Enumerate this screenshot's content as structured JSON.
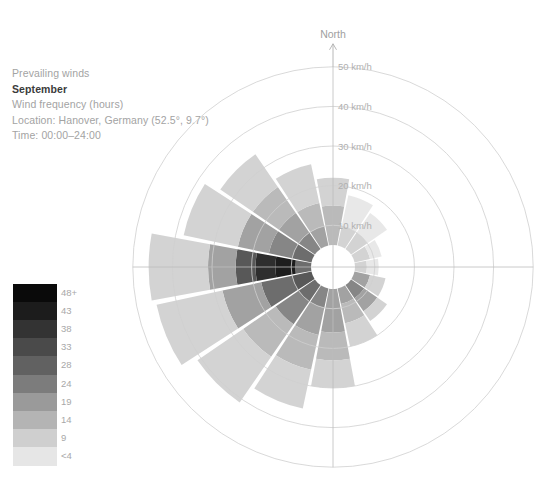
{
  "caption": {
    "line1": "Prevailing winds",
    "month": "September",
    "line3": "Wind frequency (hours)",
    "line4": "Location: Hanover, Germany (52.5°, 9.7°)",
    "line5": "Time: 00:00–24:00"
  },
  "compass": {
    "north_label": "North"
  },
  "legend": {
    "title": "",
    "labels": [
      "48+",
      "43",
      "38",
      "33",
      "28",
      "24",
      "19",
      "14",
      "9",
      "<4"
    ],
    "colors": [
      "#0a0a0a",
      "#1c1c1c",
      "#333333",
      "#4a4a4a",
      "#616161",
      "#7c7c7c",
      "#9a9a9a",
      "#b4b4b4",
      "#cfcfcf",
      "#e6e6e6"
    ]
  },
  "chart_data": {
    "type": "windrose",
    "subtitle": "Wind frequency (hours)",
    "location": "Hanover, Germany (52.5°, 9.7°)",
    "time_range": "00:00–24:00",
    "radial_axis": {
      "label": "km/h",
      "tick_labels": [
        "10 km/h",
        "20 km/h",
        "30 km/h",
        "40 km/h",
        "50 km/h"
      ],
      "ticks": [
        10,
        20,
        30,
        40,
        50
      ],
      "rmax": 50,
      "hole": 5
    },
    "color_axis": {
      "label": "Wind frequency (hours)",
      "tick_labels": [
        "<4",
        "9",
        "14",
        "19",
        "24",
        "28",
        "33",
        "38",
        "43",
        "48+"
      ],
      "values": [
        4,
        9,
        14,
        19,
        24,
        28,
        33,
        38,
        43,
        48
      ]
    },
    "grid": true,
    "sector_count": 16,
    "directions": [
      "N",
      "NNE",
      "NE",
      "ENE",
      "E",
      "ESE",
      "SE",
      "SSE",
      "S",
      "SSW",
      "SW",
      "WSW",
      "W",
      "WNW",
      "NW",
      "NNW"
    ],
    "sectors": [
      {
        "dir": "N",
        "angle": 0,
        "max_speed": 22,
        "bands": [
          {
            "from": 5,
            "to": 10,
            "hours": 14
          },
          {
            "from": 10,
            "to": 15,
            "hours": 14
          },
          {
            "from": 15,
            "to": 22,
            "hours": 9
          }
        ]
      },
      {
        "dir": "NNE",
        "angle": 22.5,
        "max_speed": 18,
        "bands": [
          {
            "from": 5,
            "to": 10,
            "hours": 9
          },
          {
            "from": 10,
            "to": 18,
            "hours": 4
          }
        ]
      },
      {
        "dir": "NE",
        "angle": 45,
        "max_speed": 16,
        "bands": [
          {
            "from": 5,
            "to": 10,
            "hours": 9
          },
          {
            "from": 10,
            "to": 16,
            "hours": 4
          }
        ]
      },
      {
        "dir": "ENE",
        "angle": 67.5,
        "max_speed": 12,
        "bands": [
          {
            "from": 5,
            "to": 9,
            "hours": 9
          },
          {
            "from": 9,
            "to": 12,
            "hours": 4
          }
        ]
      },
      {
        "dir": "E",
        "angle": 90,
        "max_speed": 11,
        "bands": [
          {
            "from": 5,
            "to": 8,
            "hours": 9
          },
          {
            "from": 8,
            "to": 11,
            "hours": 4
          }
        ]
      },
      {
        "dir": "ESE",
        "angle": 112.5,
        "max_speed": 13,
        "bands": [
          {
            "from": 5,
            "to": 9,
            "hours": 19
          },
          {
            "from": 9,
            "to": 13,
            "hours": 9
          }
        ]
      },
      {
        "dir": "SE",
        "angle": 135,
        "max_speed": 16,
        "bands": [
          {
            "from": 5,
            "to": 9,
            "hours": 24
          },
          {
            "from": 9,
            "to": 13,
            "hours": 19
          },
          {
            "from": 13,
            "to": 16,
            "hours": 9
          }
        ]
      },
      {
        "dir": "SSE",
        "angle": 157.5,
        "max_speed": 20,
        "bands": [
          {
            "from": 5,
            "to": 9,
            "hours": 19
          },
          {
            "from": 9,
            "to": 14,
            "hours": 14
          },
          {
            "from": 14,
            "to": 20,
            "hours": 9
          }
        ]
      },
      {
        "dir": "S",
        "angle": 180,
        "max_speed": 30,
        "bands": [
          {
            "from": 5,
            "to": 10,
            "hours": 19
          },
          {
            "from": 10,
            "to": 16,
            "hours": 19
          },
          {
            "from": 16,
            "to": 23,
            "hours": 14
          },
          {
            "from": 23,
            "to": 30,
            "hours": 9
          }
        ]
      },
      {
        "dir": "SSW",
        "angle": 202.5,
        "max_speed": 36,
        "bands": [
          {
            "from": 5,
            "to": 10,
            "hours": 24
          },
          {
            "from": 10,
            "to": 17,
            "hours": 19
          },
          {
            "from": 17,
            "to": 26,
            "hours": 14
          },
          {
            "from": 26,
            "to": 36,
            "hours": 9
          }
        ]
      },
      {
        "dir": "SW",
        "angle": 225,
        "max_speed": 41,
        "bands": [
          {
            "from": 5,
            "to": 10,
            "hours": 28
          },
          {
            "from": 10,
            "to": 17,
            "hours": 24
          },
          {
            "from": 17,
            "to": 27,
            "hours": 14
          },
          {
            "from": 27,
            "to": 41,
            "hours": 9
          }
        ]
      },
      {
        "dir": "WSW",
        "angle": 247.5,
        "max_speed": 45,
        "bands": [
          {
            "from": 5,
            "to": 10,
            "hours": 33
          },
          {
            "from": 10,
            "to": 18,
            "hours": 28
          },
          {
            "from": 18,
            "to": 28,
            "hours": 19
          },
          {
            "from": 28,
            "to": 45,
            "hours": 9
          }
        ]
      },
      {
        "dir": "W",
        "angle": 270,
        "max_speed": 46,
        "bands": [
          {
            "from": 5,
            "to": 9,
            "hours": 28
          },
          {
            "from": 9,
            "to": 14,
            "hours": 48
          },
          {
            "from": 14,
            "to": 19,
            "hours": 43
          },
          {
            "from": 19,
            "to": 24,
            "hours": 33
          },
          {
            "from": 24,
            "to": 31,
            "hours": 19
          },
          {
            "from": 31,
            "to": 46,
            "hours": 9
          }
        ]
      },
      {
        "dir": "WNW",
        "angle": 292.5,
        "max_speed": 38,
        "bands": [
          {
            "from": 5,
            "to": 10,
            "hours": 28
          },
          {
            "from": 10,
            "to": 16,
            "hours": 24
          },
          {
            "from": 16,
            "to": 24,
            "hours": 19
          },
          {
            "from": 24,
            "to": 38,
            "hours": 9
          }
        ]
      },
      {
        "dir": "NW",
        "angle": 315,
        "max_speed": 34,
        "bands": [
          {
            "from": 5,
            "to": 10,
            "hours": 24
          },
          {
            "from": 10,
            "to": 16,
            "hours": 19
          },
          {
            "from": 16,
            "to": 24,
            "hours": 14
          },
          {
            "from": 24,
            "to": 34,
            "hours": 9
          }
        ]
      },
      {
        "dir": "NNW",
        "angle": 337.5,
        "max_speed": 26,
        "bands": [
          {
            "from": 5,
            "to": 10,
            "hours": 19
          },
          {
            "from": 10,
            "to": 16,
            "hours": 14
          },
          {
            "from": 16,
            "to": 26,
            "hours": 9
          }
        ]
      }
    ],
    "geometry": {
      "cx": 333,
      "cy": 267,
      "r_per_kmh": 3.96,
      "hole_radius": 22,
      "sector_gap_deg": 1.6
    },
    "style": {
      "grid_color": "#cfcfcf",
      "axis_color": "#bdbdbd",
      "background": "#ffffff"
    }
  }
}
